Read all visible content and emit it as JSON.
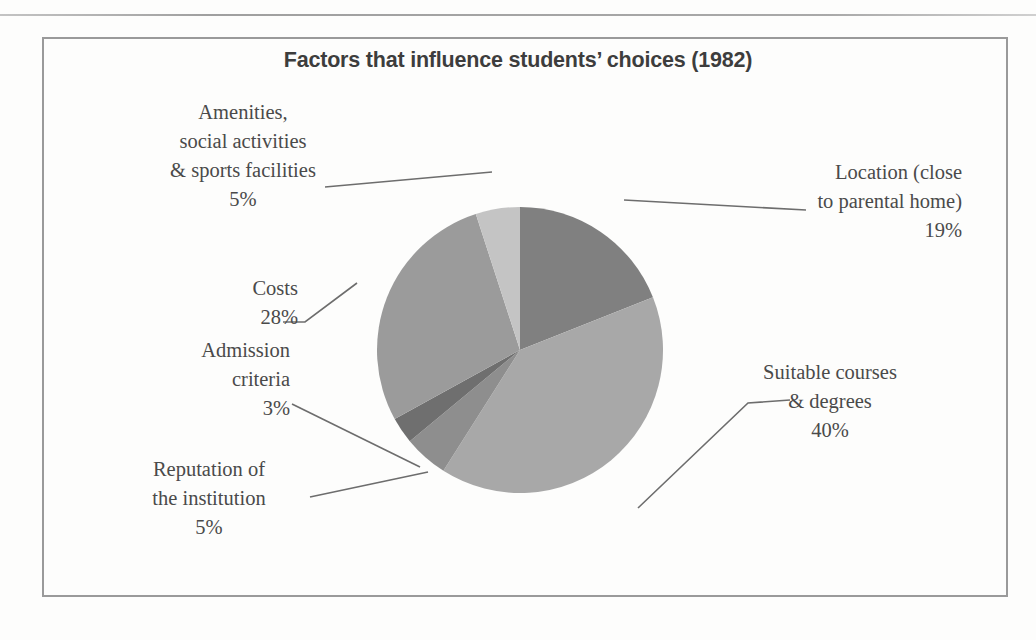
{
  "chart_data": {
    "type": "pie",
    "title": "Factors that influence students’ choices (1982)",
    "categories": [
      "Location (close to parental home)",
      "Suitable courses & degrees",
      "Reputation of the institution",
      "Admission criteria",
      "Costs",
      "Amenities, social activities & sports facilities"
    ],
    "values": [
      19,
      40,
      5,
      3,
      28,
      5
    ],
    "value_unit": "%",
    "colors": [
      "#808080",
      "#a8a8a8",
      "#8e8e8e",
      "#6f6f6f",
      "#9b9b9b",
      "#c4c4c4"
    ],
    "start_angle_deg": 0,
    "direction": "clockwise",
    "legend": "none",
    "labels_position": "outside-with-leader-lines",
    "slices": [
      {
        "label": "Location (close to parental home)",
        "value": 19,
        "display": "19%",
        "color": "#808080"
      },
      {
        "label": "Suitable courses & degrees",
        "value": 40,
        "display": "40%",
        "color": "#a8a8a8"
      },
      {
        "label": "Reputation of the institution",
        "value": 5,
        "display": "5%",
        "color": "#8e8e8e"
      },
      {
        "label": "Admission criteria",
        "value": 3,
        "display": "3%",
        "color": "#6f6f6f"
      },
      {
        "label": "Costs",
        "value": 28,
        "display": "28%",
        "color": "#9b9b9b"
      },
      {
        "label": "Amenities, social activities & sports facilities",
        "value": 5,
        "display": "5%",
        "color": "#c4c4c4"
      }
    ]
  },
  "title": "Factors that influence students’ choices (1982)",
  "labels": {
    "amenities": {
      "line1": "Amenities,",
      "line2": "social activities",
      "line3": "& sports facilities",
      "pct": "5%"
    },
    "location": {
      "line1": "Location (close",
      "line2": "to parental home)",
      "pct": "19%"
    },
    "costs": {
      "line1": "Costs",
      "pct": "28%"
    },
    "admission": {
      "line1": "Admission",
      "line2": "criteria",
      "pct": "3%"
    },
    "reputation": {
      "line1": "Reputation of",
      "line2": "the institution",
      "pct": "5%"
    },
    "courses": {
      "line1": "Suitable courses",
      "line2": "& degrees",
      "pct": "40%"
    }
  }
}
